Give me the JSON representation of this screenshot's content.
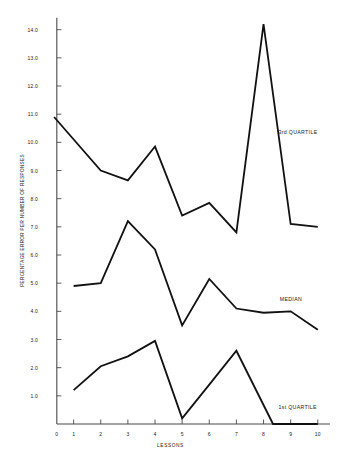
{
  "chart_data": {
    "type": "line",
    "title": "",
    "xlabel": "LESSONS",
    "ylabel": "PERCENTAGE ERROR PER NUMBER OF RESPONSES",
    "xlim": [
      0,
      10.45
    ],
    "ylim": [
      0,
      14.45
    ],
    "xticks": [
      0,
      1,
      2,
      3,
      4,
      5,
      6,
      7,
      8,
      9,
      10
    ],
    "xticklabels": [
      "0",
      "1",
      "2",
      "3",
      "4",
      "5",
      "6",
      "7",
      "8",
      "9",
      "10"
    ],
    "yticks": [
      0,
      1.0,
      2.0,
      3.0,
      4.0,
      5.0,
      6.0,
      7.0,
      8.0,
      9.0,
      10.0,
      11.0,
      12.0,
      13.0,
      14.0
    ],
    "yticklabels": [
      "0",
      "1.0",
      "2.0",
      "3.0",
      "4.0",
      "5.0",
      "6.0",
      "7.0",
      "8.0",
      "9.0",
      "10.0",
      "11.0",
      "12.0",
      "13.0",
      "14.0"
    ],
    "grid": false,
    "legend_position": "inline-annotation",
    "line_color": "#111111",
    "series": [
      {
        "name": "3rd QUARTILE",
        "label_x": 8.55,
        "label_y": 10.35,
        "x": [
          0.28,
          2,
          3,
          4,
          5,
          6,
          7,
          8,
          9,
          10
        ],
        "values": [
          10.9,
          9.0,
          8.65,
          9.85,
          7.4,
          7.85,
          6.8,
          14.2,
          7.1,
          7.0
        ]
      },
      {
        "name": "MEDIAN",
        "label_x": 8.6,
        "label_y": 4.45,
        "x": [
          1,
          2,
          3,
          4,
          5,
          6,
          7,
          8,
          9,
          10
        ],
        "values": [
          4.9,
          5.0,
          7.2,
          6.2,
          3.5,
          5.15,
          4.1,
          3.95,
          4.0,
          3.35
        ]
      },
      {
        "name": "1st QUARTILE",
        "label_x": 8.55,
        "label_y": 0.62,
        "x": [
          1,
          2,
          3,
          4,
          5,
          6,
          7,
          8.35,
          10
        ],
        "values": [
          1.2,
          2.05,
          2.4,
          2.95,
          0.2,
          1.4,
          2.6,
          0.0,
          0.0
        ]
      }
    ]
  }
}
